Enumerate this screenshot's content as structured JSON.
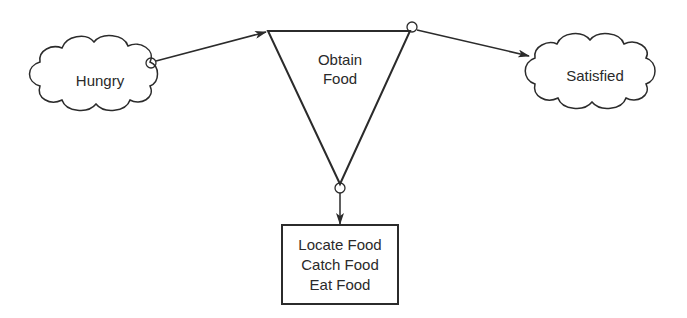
{
  "diagram": {
    "type": "state-transition",
    "nodes": {
      "hungry": {
        "label": "Hungry",
        "shape": "cloud"
      },
      "obtain_food": {
        "line1": "Obtain",
        "line2": "Food",
        "shape": "inverted-triangle"
      },
      "satisfied": {
        "label": "Satisfied",
        "shape": "cloud"
      },
      "subtasks": {
        "lines": [
          "Locate Food",
          "Catch Food",
          "Eat Food"
        ],
        "shape": "rectangle"
      }
    },
    "edges": [
      {
        "from": "hungry",
        "to": "obtain_food"
      },
      {
        "from": "obtain_food",
        "to": "satisfied"
      },
      {
        "from": "obtain_food",
        "to": "subtasks"
      }
    ],
    "colors": {
      "stroke": "#2b2b2b",
      "background": "#ffffff"
    }
  }
}
